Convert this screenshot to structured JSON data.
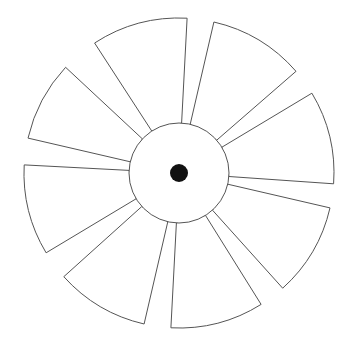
{
  "diagram": {
    "type": "pinwheel-fan",
    "canvas": {
      "width": 359,
      "height": 346,
      "background": "#ffffff"
    },
    "center": {
      "x": 179,
      "y": 173
    },
    "hub": {
      "radius": 50,
      "fill": "#ffffff",
      "stroke": "#555555"
    },
    "center_dot": {
      "radius": 9,
      "fill": "#111111"
    },
    "blade_style": {
      "outer_radius": 155,
      "inner_radius": 50,
      "fill": "#ffffff",
      "stroke": "#555555"
    },
    "blades": [
      {
        "id": 1,
        "start_angle": -123,
        "end_angle": -87
      },
      {
        "id": 2,
        "start_angle": -77,
        "end_angle": -41
      },
      {
        "id": 3,
        "start_angle": -31,
        "end_angle": 4
      },
      {
        "id": 4,
        "start_angle": 13,
        "end_angle": 48
      },
      {
        "id": 5,
        "start_angle": 58,
        "end_angle": 93
      },
      {
        "id": 6,
        "start_angle": 103,
        "end_angle": 138
      },
      {
        "id": 7,
        "start_angle": 149,
        "end_angle": 183
      },
      {
        "id": 8,
        "start_angle": 193,
        "end_angle": 223
      }
    ]
  }
}
